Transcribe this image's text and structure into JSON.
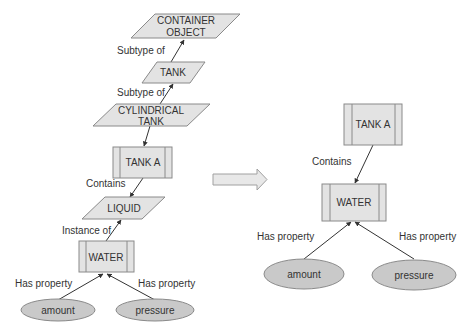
{
  "colors": {
    "node_fill": "#e3e3e3",
    "node_stroke": "#8a8a8a",
    "ellipse_fill": "#c9c9c9",
    "edge": "#333333",
    "text": "#333333"
  },
  "left_diagram": {
    "nodes": {
      "container_object": {
        "line1": "CONTAINER",
        "line2": "OBJECT",
        "shape": "parallelogram"
      },
      "tank": {
        "label": "TANK",
        "shape": "parallelogram"
      },
      "cylindrical_tank": {
        "line1": "CYLINDRICAL",
        "line2": "TANK",
        "shape": "parallelogram"
      },
      "tank_a": {
        "label": "TANK A",
        "shape": "predefined-process"
      },
      "liquid": {
        "label": "LIQUID",
        "shape": "parallelogram"
      },
      "water": {
        "label": "WATER",
        "shape": "predefined-process"
      },
      "amount": {
        "label": "amount",
        "shape": "ellipse"
      },
      "pressure": {
        "label": "pressure",
        "shape": "ellipse"
      }
    },
    "edges": {
      "tank_to_container": "Subtype of",
      "cyl_to_tank": "Subtype of",
      "tanka_to_liquid": "Contains",
      "water_to_liquid": "Instance of",
      "amount_to_water": "Has property",
      "pressure_to_water": "Has property"
    }
  },
  "transform_arrow": {
    "icon": "right-arrow-icon"
  },
  "right_diagram": {
    "nodes": {
      "tank_a": {
        "label": "TANK A",
        "shape": "predefined-process"
      },
      "water": {
        "label": "WATER",
        "shape": "predefined-process"
      },
      "amount": {
        "label": "amount",
        "shape": "ellipse"
      },
      "pressure": {
        "label": "pressure",
        "shape": "ellipse"
      }
    },
    "edges": {
      "tanka_to_water": "Contains",
      "amount_to_water": "Has property",
      "pressure_to_water": "Has property"
    }
  }
}
